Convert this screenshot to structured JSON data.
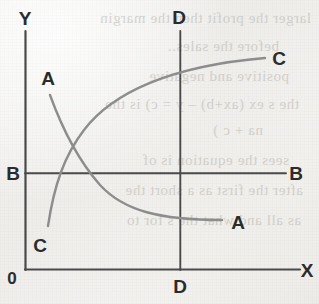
{
  "figure": {
    "background_color": "#f1f0ed",
    "axis_color": "#4a4a4a",
    "curve_color": "#8d8d8d",
    "label_color": "#2b2b2b",
    "axes": {
      "y_axis_label": "Y",
      "x_axis_label": "X",
      "origin_label": "0"
    },
    "reference_lines": [
      {
        "name": "B-B horizontal",
        "left_label": "B",
        "right_label": "B",
        "orientation": "horizontal"
      },
      {
        "name": "D-D vertical",
        "top_label": "D",
        "bottom_label": "D",
        "orientation": "vertical"
      }
    ],
    "curves": [
      {
        "name": "curve-A",
        "start_label": "A",
        "end_label": "A",
        "shape": "decreasing-convex",
        "description": "Falls from upper-left, crosses B-B line and curve C, flattens toward lower right below B-B"
      },
      {
        "name": "curve-C",
        "start_label": "C",
        "end_label": "C",
        "shape": "increasing-concave",
        "description": "Rises from lower-left below B-B, crosses curve A, flattens toward upper right above B-B"
      }
    ],
    "intersection": {
      "label": "",
      "note": "Curves A and C cross above the B-B line, left of the D-D line"
    }
  },
  "ghost_text": [
    {
      "text": "larger the profit then the margin",
      "x": 8,
      "y": 10
    },
    {
      "text": "before the sales..",
      "x": 40,
      "y": 38
    },
    {
      "text": "positive and negative",
      "x": 30,
      "y": 68
    },
    {
      "text": "the s ex (ax+b) – y = c) is the",
      "x": 20,
      "y": 96
    },
    {
      "text": "na + c )",
      "x": 56,
      "y": 122
    },
    {
      "text": "sees the equation is of",
      "x": 30,
      "y": 152
    },
    {
      "text": "after the first as a short the",
      "x": 16,
      "y": 182
    },
    {
      "text": "as all and what the s for to",
      "x": 18,
      "y": 212
    }
  ]
}
